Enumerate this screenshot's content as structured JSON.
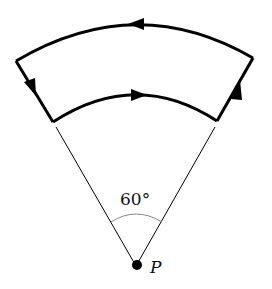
{
  "diagram": {
    "angle_label": "60°",
    "point_label": "P",
    "colors": {
      "stroke": "#000000",
      "background": "#ffffff",
      "angle_arc": "#888888"
    }
  }
}
